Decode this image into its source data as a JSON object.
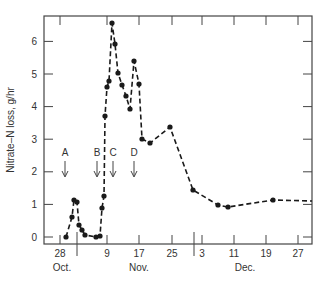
{
  "chart_data": {
    "type": "line",
    "title": "",
    "xlabel": "",
    "ylabel": "Nitrate–N loss, g/hr",
    "ylim": [
      0,
      6.8
    ],
    "yticks": [
      0,
      1,
      2,
      3,
      4,
      5,
      6
    ],
    "grid": false,
    "legend": null,
    "xtick_labels": [
      "28",
      "9",
      "17",
      "25",
      "3",
      "11",
      "19",
      "27"
    ],
    "month_labels": [
      "Oct.",
      "Nov.",
      "Dec."
    ],
    "annotations": [
      {
        "label": "A",
        "type": "down-arrow",
        "x_date": "Oct 29"
      },
      {
        "label": "B",
        "type": "down-arrow",
        "x_date": "Nov 7"
      },
      {
        "label": "C",
        "type": "down-arrow",
        "x_date": "Nov 11"
      },
      {
        "label": "D",
        "type": "down-arrow",
        "x_date": "Nov 16"
      }
    ],
    "series": [
      {
        "name": "Nitrate-N loss",
        "style": "dashed line with filled circle markers",
        "color": "#1a1a1a",
        "x": [
          "Oct 29.5",
          "Oct 31",
          "Oct 31.5",
          "Nov 1",
          "Nov 2",
          "Nov 3",
          "Nov 4",
          "Nov 6.5",
          "Nov 7.5",
          "Nov 8",
          "Nov 8.5",
          "Nov 9",
          "Nov 9.5",
          "Nov 10",
          "Nov 10.5",
          "Nov 11.5",
          "Nov 12",
          "Nov 13",
          "Nov 14",
          "Nov 15",
          "Nov 16",
          "Nov 17",
          "Nov 18",
          "Nov 20",
          "Nov 25",
          "Dec 2",
          "Dec 7",
          "Dec 9.5",
          "Dec 21"
        ],
        "values": [
          0,
          0.6,
          1.15,
          1.05,
          0.35,
          0.25,
          0.05,
          0,
          0.03,
          0.85,
          1.35,
          3.65,
          4.55,
          4.75,
          6.55,
          5.9,
          4.95,
          4.6,
          4.2,
          3.85,
          5.35,
          4.65,
          3.0,
          2.85,
          3.35,
          1.4,
          0.95,
          0.9,
          1.1
        ],
        "continues_to_right_edge_value": 1.1
      }
    ]
  },
  "render": {
    "frame": {
      "left": 44,
      "right": 312,
      "top": 16,
      "bottom": 244
    },
    "y_px_per_unit": 32.6,
    "y_zero_px": 237,
    "points_px": [
      [
        66,
        237
      ],
      [
        72,
        217
      ],
      [
        74,
        200
      ],
      [
        77,
        202
      ],
      [
        79,
        225
      ],
      [
        82,
        230
      ],
      [
        85,
        235
      ],
      [
        96,
        237
      ],
      [
        100,
        236
      ],
      [
        102,
        208
      ],
      [
        104,
        196
      ],
      [
        105,
        116
      ],
      [
        107,
        87
      ],
      [
        109,
        81
      ],
      [
        112,
        23
      ],
      [
        115,
        44
      ],
      [
        118,
        73
      ],
      [
        122,
        85
      ],
      [
        126,
        96
      ],
      [
        130,
        109
      ],
      [
        134,
        61
      ],
      [
        139,
        84
      ],
      [
        142,
        139
      ],
      [
        150,
        143
      ],
      [
        170,
        127
      ],
      [
        193,
        190
      ],
      [
        218,
        205
      ],
      [
        228,
        207
      ],
      [
        273,
        200
      ]
    ],
    "line_end_px": [
      312,
      201
    ],
    "xticks_px": [
      60,
      107,
      139,
      172,
      202,
      234,
      266,
      298
    ],
    "xtick_top_px": [],
    "break_marker_px": 194,
    "month_label_px": [
      {
        "x": 62,
        "label": "Oct."
      },
      {
        "x": 139,
        "label": "Nov."
      },
      {
        "x": 245,
        "label": "Dec."
      }
    ],
    "arrows_px": [
      {
        "x": 65,
        "label": "A"
      },
      {
        "x": 97,
        "label": "B"
      },
      {
        "x": 113,
        "label": "C"
      },
      {
        "x": 134,
        "label": "D"
      }
    ]
  }
}
